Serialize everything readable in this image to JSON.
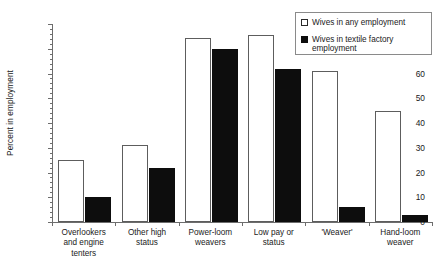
{
  "chart_data": {
    "type": "bar",
    "title": "",
    "xlabel": "",
    "ylabel": "Percent in employment",
    "ylim": [
      0,
      80
    ],
    "ytick_values": [
      0,
      10,
      20,
      30,
      40,
      50,
      60,
      70,
      80
    ],
    "ytick_labels": [
      "0",
      "10",
      "20",
      "30",
      "40",
      "50",
      "60",
      "70",
      "80"
    ],
    "grid": false,
    "legend_position": "top-right",
    "categories": [
      "Overlookers and engine tenters",
      "Other high status",
      "Power-loom weavers",
      "Low pay or status",
      "'Weaver'",
      "Hand-loom weaver"
    ],
    "category_lines": [
      [
        "Overlookers",
        "and engine",
        "tenters"
      ],
      [
        "Other high",
        "status"
      ],
      [
        "Power-loom",
        "weavers"
      ],
      [
        "Low pay or",
        "status"
      ],
      [
        "'Weaver'"
      ],
      [
        "Hand-loom",
        "weaver"
      ]
    ],
    "series": [
      {
        "name": "Wives in any employment",
        "style": "open",
        "color": "#ffffff",
        "edge_color": "#5d5d5d",
        "values": [
          25,
          31,
          74.5,
          75.5,
          61,
          45
        ]
      },
      {
        "name": "Wives in textile factory employment",
        "style": "filled",
        "color": "#0d0d0d",
        "edge_color": "#0d0d0d",
        "values": [
          10,
          22,
          70,
          62,
          6,
          3
        ]
      }
    ]
  },
  "legend": {
    "items": [
      {
        "label": "Wives in any employment",
        "style": "open"
      },
      {
        "label": "Wives in textile factory employment",
        "style": "filled"
      }
    ]
  },
  "axes": {
    "y_title": "Percent in employment"
  }
}
